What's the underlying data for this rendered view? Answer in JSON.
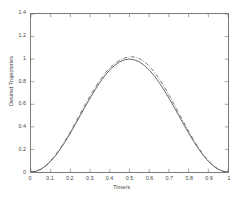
{
  "chart_data": {
    "type": "line",
    "title": "",
    "xlabel": "Time/s",
    "ylabel": "Desired Trajectories",
    "xlim": [
      0,
      1
    ],
    "ylim": [
      0,
      1.4
    ],
    "grid": false,
    "legend": "none",
    "xticks": [
      "0",
      "0.1",
      "0.2",
      "0.3",
      "0.4",
      "0.5",
      "0.6",
      "0.7",
      "0.8",
      "0.9",
      "1"
    ],
    "xtick_values": [
      0,
      0.1,
      0.2,
      0.3,
      0.4,
      0.5,
      0.6,
      0.7,
      0.8,
      0.9,
      1
    ],
    "yticks": [
      "0",
      "0.2",
      "0.4",
      "0.6",
      "0.8",
      "1",
      "1.2",
      "1.4"
    ],
    "ytick_values": [
      0,
      0.2,
      0.4,
      0.6,
      0.8,
      1,
      1.2,
      1.4
    ],
    "x": [
      0,
      0.025,
      0.05,
      0.075,
      0.1,
      0.125,
      0.15,
      0.175,
      0.2,
      0.225,
      0.25,
      0.275,
      0.3,
      0.325,
      0.35,
      0.375,
      0.4,
      0.425,
      0.45,
      0.475,
      0.5,
      0.525,
      0.55,
      0.575,
      0.6,
      0.625,
      0.65,
      0.675,
      0.7,
      0.725,
      0.75,
      0.775,
      0.8,
      0.825,
      0.85,
      0.875,
      0.9,
      0.925,
      0.95,
      0.975,
      1
    ],
    "series": [
      {
        "name": "trajectory-solid",
        "style": "solid",
        "color": "#555555",
        "values": [
          0,
          0.006,
          0.024,
          0.055,
          0.095,
          0.146,
          0.206,
          0.273,
          0.345,
          0.421,
          0.5,
          0.579,
          0.655,
          0.727,
          0.794,
          0.854,
          0.905,
          0.945,
          0.976,
          0.994,
          1.0,
          0.994,
          0.976,
          0.945,
          0.905,
          0.854,
          0.794,
          0.727,
          0.655,
          0.579,
          0.5,
          0.421,
          0.345,
          0.273,
          0.206,
          0.146,
          0.095,
          0.055,
          0.024,
          0.006,
          0
        ]
      },
      {
        "name": "trajectory-dashdot",
        "style": "dash-dot",
        "color": "#666666",
        "values": [
          0,
          0.006,
          0.025,
          0.057,
          0.099,
          0.152,
          0.214,
          0.283,
          0.357,
          0.436,
          0.517,
          0.597,
          0.675,
          0.748,
          0.815,
          0.874,
          0.923,
          0.961,
          0.99,
          1.01,
          1.02,
          1.019,
          1.005,
          0.978,
          0.939,
          0.889,
          0.828,
          0.759,
          0.684,
          0.605,
          0.523,
          0.441,
          0.361,
          0.286,
          0.216,
          0.153,
          0.1,
          0.058,
          0.026,
          0.007,
          0
        ]
      }
    ]
  }
}
